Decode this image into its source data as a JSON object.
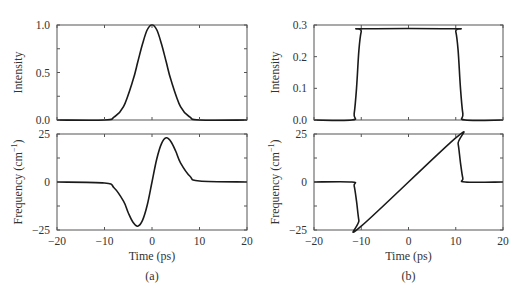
{
  "figure": {
    "panels": [
      {
        "caption": "(a)",
        "top": {
          "ylabel": "Intensity",
          "yticks": [
            "0.0",
            "0.5",
            "1.0"
          ],
          "ylim": [
            0,
            1
          ]
        },
        "bottom": {
          "ylabel": "Frequency (cm",
          "ylabel_sup": "−1",
          "ylabel_end": ")",
          "yticks": [
            "−25",
            "0",
            "25"
          ],
          "ylim": [
            -25,
            25
          ],
          "xlabel": "Time (ps)",
          "xticks": [
            "−20",
            "−10",
            "0",
            "10",
            "20"
          ]
        }
      },
      {
        "caption": "(b)",
        "top": {
          "ylabel": "Intensity",
          "yticks": [
            "0.0",
            "0.1",
            "0.2",
            "0.3"
          ],
          "ylim": [
            0,
            0.3
          ]
        },
        "bottom": {
          "ylabel": "Frequency (cm",
          "ylabel_sup": "−1",
          "ylabel_end": ")",
          "yticks": [
            "−25",
            "0",
            "25"
          ],
          "ylim": [
            -25,
            25
          ],
          "xlabel": "Time (ps)",
          "xticks": [
            "−20",
            "−10",
            "0",
            "10",
            "20"
          ]
        }
      }
    ]
  },
  "chart_data": [
    {
      "type": "line",
      "panel": "(a) top",
      "title": "",
      "xlabel": "",
      "ylabel": "Intensity",
      "xlim": [
        -20,
        20
      ],
      "ylim": [
        0,
        1
      ],
      "grid": false,
      "series": [
        {
          "name": "Gaussian pulse intensity",
          "x": [
            -20,
            -10,
            -8,
            -6,
            -4,
            -3,
            -2,
            -1,
            0,
            1,
            2,
            3,
            4,
            6,
            8,
            10,
            20
          ],
          "values": [
            0,
            0.0,
            0.03,
            0.14,
            0.42,
            0.61,
            0.8,
            0.95,
            1.0,
            0.95,
            0.8,
            0.61,
            0.42,
            0.14,
            0.03,
            0.0,
            0
          ]
        }
      ]
    },
    {
      "type": "line",
      "panel": "(a) bottom",
      "title": "",
      "xlabel": "Time (ps)",
      "ylabel": "Frequency (cm−1)",
      "xlim": [
        -20,
        20
      ],
      "ylim": [
        -25,
        25
      ],
      "grid": false,
      "series": [
        {
          "name": "Instantaneous frequency",
          "x": [
            -20,
            -10,
            -8,
            -6,
            -5,
            -4,
            -3,
            -2,
            -1,
            0,
            1,
            2,
            3,
            4,
            5,
            6,
            8,
            10,
            20
          ],
          "values": [
            0,
            -0.5,
            -3,
            -10,
            -16,
            -21,
            -23,
            -20,
            -12,
            0,
            12,
            20,
            23,
            21,
            16,
            10,
            3,
            0.5,
            0
          ]
        }
      ]
    },
    {
      "type": "line",
      "panel": "(b) top",
      "title": "",
      "xlabel": "",
      "ylabel": "Intensity",
      "xlim": [
        -20,
        20
      ],
      "ylim": [
        0,
        0.3
      ],
      "grid": false,
      "series": [
        {
          "name": "Flat-top (parabolic-chirp) pulse intensity",
          "x": [
            -20,
            -12,
            -11.5,
            -11,
            -10.5,
            -10,
            -9.5,
            9.5,
            10,
            10.5,
            11,
            11.5,
            12,
            20
          ],
          "values": [
            0,
            0,
            0.02,
            0.1,
            0.22,
            0.28,
            0.288,
            0.288,
            0.28,
            0.22,
            0.1,
            0.02,
            0,
            0
          ]
        }
      ]
    },
    {
      "type": "line",
      "panel": "(b) bottom",
      "title": "",
      "xlabel": "Time (ps)",
      "ylabel": "Frequency (cm−1)",
      "xlim": [
        -20,
        20
      ],
      "ylim": [
        -25,
        25
      ],
      "grid": false,
      "series": [
        {
          "name": "Instantaneous frequency (linear chirp)",
          "x": [
            -20,
            -12,
            -11.5,
            -11,
            -10.5,
            -10,
            10,
            10.5,
            11,
            11.5,
            12,
            20
          ],
          "values": [
            0,
            0,
            -2,
            -10,
            -20,
            -23,
            23,
            20,
            10,
            2,
            0,
            0
          ]
        }
      ]
    }
  ]
}
